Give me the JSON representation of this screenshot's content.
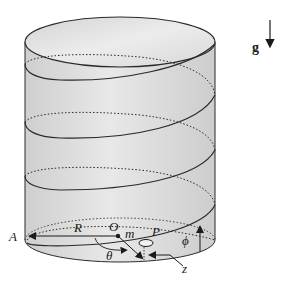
{
  "diagram": {
    "labels": {
      "gravity": "g",
      "point_A": "A",
      "radius": "R",
      "origin": "O",
      "mass": "m",
      "point_P": "P",
      "theta": "θ",
      "z": "z",
      "phi": "ϕ"
    },
    "colors": {
      "cylinder_fill": "#d9d9d9",
      "cylinder_top_fill": "#e6e6e6",
      "stroke": "#2a2a2a",
      "bead_fill": "#f0f0f0"
    }
  }
}
